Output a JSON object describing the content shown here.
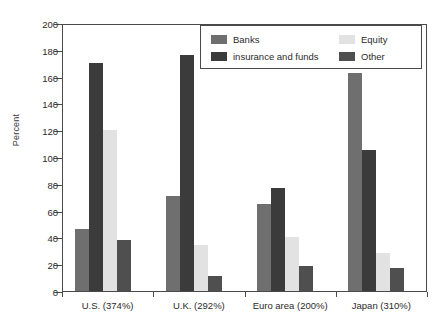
{
  "chart_data": {
    "type": "bar",
    "title": "",
    "subtitle": "",
    "xlabel": "",
    "ylabel": "Percent",
    "ylim": [
      0,
      200
    ],
    "ytick_step": 20,
    "yticks": [
      0,
      20,
      40,
      60,
      80,
      100,
      120,
      140,
      160,
      180,
      200
    ],
    "ytick_labels": [
      "0",
      "20",
      "40",
      "60",
      "80",
      "100",
      "120",
      "140",
      "160",
      "180",
      "200"
    ],
    "grid": false,
    "legend_position": "top-right",
    "categories": [
      "U.S. (374%)",
      "U.K. (292%)",
      "Euro area (200%)",
      "Japan (310%)"
    ],
    "series": [
      {
        "name": "Banks",
        "color": "#6f6f6f",
        "values": [
          46,
          71,
          65,
          163
        ]
      },
      {
        "name": "insurance and funds",
        "color": "#3b3b3b",
        "values": [
          170,
          176,
          77,
          105
        ]
      },
      {
        "name": "Equity",
        "color": "#e2e2e2",
        "values": [
          120,
          34,
          40,
          28
        ]
      },
      {
        "name": "Other",
        "color": "#4f4f4f",
        "values": [
          38,
          11,
          19,
          17
        ]
      }
    ]
  },
  "legend": {
    "entries": [
      {
        "label": "Banks",
        "color": "#6f6f6f"
      },
      {
        "label": "Equity",
        "color": "#e2e2e2"
      },
      {
        "label": "insurance and funds",
        "color": "#3b3b3b"
      },
      {
        "label": "Other",
        "color": "#4f4f4f"
      }
    ]
  },
  "axis": {
    "frame_color": "#4a4a4a",
    "text_color": "#2b2b2b"
  }
}
